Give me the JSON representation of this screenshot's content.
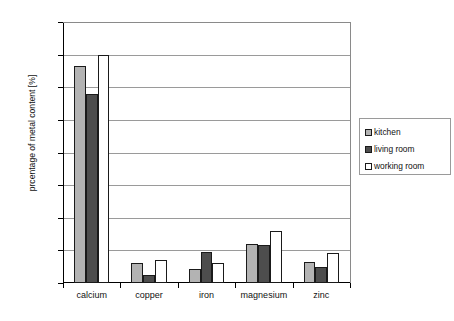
{
  "chart_data": {
    "type": "bar",
    "title": "",
    "subtitle": "",
    "xlabel": "",
    "ylabel": "prcentage of metal content [%]",
    "categories": [
      "calcium",
      "copper",
      "iron",
      "magnesium",
      "zinc"
    ],
    "series": [
      {
        "name": "kitchen",
        "color": "#b3b3b3",
        "values": [
          3.33,
          0.3,
          0.22,
          0.6,
          0.32
        ]
      },
      {
        "name": "living room",
        "color": "#4d4d4d",
        "values": [
          2.9,
          0.13,
          0.48,
          0.58,
          0.24
        ]
      },
      {
        "name": "working room",
        "color": "#ffffff",
        "values": [
          3.49,
          0.35,
          0.31,
          0.8,
          0.46
        ]
      }
    ],
    "ylim": [
      0,
      4
    ],
    "yticks": [
      "0",
      "0.5",
      "1",
      "1.5",
      "2",
      "2.5",
      "3",
      "3.5",
      "4"
    ],
    "ytick_values": [
      0,
      0.5,
      1,
      1.5,
      2,
      2.5,
      3,
      3.5,
      4
    ],
    "grid": "horizontal",
    "legend_position": "right",
    "legend_entries": [
      "kitchen",
      "living room",
      "working room"
    ],
    "background_color": "#ffffff",
    "axis_color": "#000000",
    "gridline_color": "#9a9a9a"
  }
}
